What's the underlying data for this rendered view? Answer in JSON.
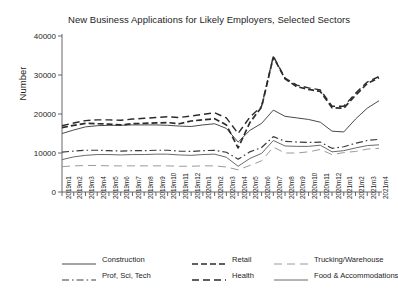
{
  "chart_data": {
    "type": "line",
    "title": "New Business Applications for Likely Employers, Selected Sectors",
    "xlabel": "",
    "ylabel": "Number",
    "ylim": [
      0,
      40000
    ],
    "yticks": [
      0,
      10000,
      20000,
      30000,
      40000
    ],
    "ytick_labels": [
      "0",
      "10000",
      "20000",
      "30000",
      "40000"
    ],
    "grid": false,
    "legend_position": "bottom",
    "categories": [
      "2019m1",
      "2019m2",
      "2019m3",
      "2019m4",
      "2019m5",
      "2019m6",
      "2019m7",
      "2019m8",
      "2019m9",
      "2019m10",
      "2019m11",
      "2019m12",
      "2020m1",
      "2020m2",
      "2020m3",
      "2020m4",
      "2020m5",
      "2020m6",
      "2020m7",
      "2020m8",
      "2020m9",
      "2020m10",
      "2020m11",
      "2020m12",
      "2021m1",
      "2021m2",
      "2021m3",
      "2021m4"
    ],
    "series": [
      {
        "name": "Construction",
        "style": "solid",
        "color": "#4a4a4a",
        "width": 1.0,
        "values": [
          15000,
          15900,
          16700,
          17000,
          17100,
          17100,
          17200,
          17200,
          17200,
          17100,
          16900,
          16800,
          17200,
          17500,
          16300,
          12800,
          15800,
          17600,
          21000,
          19400,
          19000,
          18600,
          17900,
          15600,
          15400,
          18700,
          21500,
          23400
        ]
      },
      {
        "name": "Retail",
        "style": "heavy-dash",
        "color": "#2b2b2b",
        "width": 1.7,
        "values": [
          16500,
          17100,
          17600,
          17500,
          17400,
          17200,
          17500,
          17600,
          17700,
          17800,
          17500,
          18200,
          18500,
          18800,
          17200,
          11300,
          17800,
          21800,
          34600,
          29000,
          27000,
          26300,
          25800,
          21600,
          21500,
          24800,
          27800,
          29300
        ]
      },
      {
        "name": "Trucking/Warehouse",
        "style": "light-dash",
        "color": "#9a9a9a",
        "width": 1.0,
        "values": [
          6500,
          6700,
          6800,
          6800,
          6700,
          6700,
          6700,
          6700,
          6700,
          6700,
          6600,
          6600,
          6700,
          6700,
          6400,
          5700,
          6800,
          8000,
          11500,
          10000,
          10000,
          10300,
          10900,
          9600,
          10100,
          10400,
          11000,
          11200
        ]
      },
      {
        "name": "Prof, Sci, Tech",
        "style": "dash-dot",
        "color": "#3a3a3a",
        "width": 1.2,
        "values": [
          10200,
          10500,
          10700,
          10700,
          10600,
          10500,
          10600,
          10600,
          10700,
          10700,
          10500,
          10400,
          10600,
          10700,
          10200,
          8400,
          10300,
          11400,
          14200,
          13000,
          12800,
          12700,
          12800,
          11200,
          11600,
          12500,
          13200,
          13500
        ]
      },
      {
        "name": "Health",
        "style": "medium-dash",
        "color": "#2b2b2b",
        "width": 1.4,
        "values": [
          17000,
          17700,
          18300,
          18500,
          18500,
          18400,
          18700,
          18900,
          19100,
          19300,
          19100,
          19500,
          19900,
          20300,
          19000,
          15000,
          19200,
          22000,
          34800,
          29200,
          27400,
          26700,
          26200,
          22000,
          22000,
          25300,
          28200,
          29600
        ]
      },
      {
        "name": "Food & Accommodations",
        "style": "solid",
        "color": "#6a6a6a",
        "width": 1.0,
        "values": [
          8300,
          9000,
          9400,
          9600,
          9600,
          9500,
          9600,
          9600,
          9700,
          9700,
          9500,
          9400,
          9600,
          9700,
          8900,
          6600,
          8600,
          9900,
          13200,
          11800,
          11700,
          11700,
          12000,
          10300,
          10600,
          11300,
          11900,
          12100
        ]
      }
    ]
  },
  "legend": {
    "items": [
      {
        "label": "Construction"
      },
      {
        "label": "Retail"
      },
      {
        "label": "Trucking/Warehouse"
      },
      {
        "label": "Prof, Sci, Tech"
      },
      {
        "label": "Health"
      },
      {
        "label": "Food & Accommodations"
      }
    ]
  }
}
